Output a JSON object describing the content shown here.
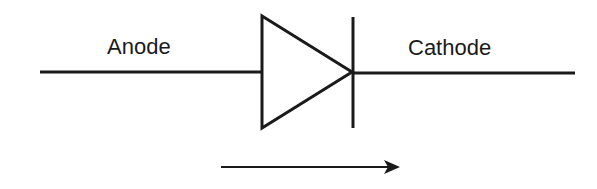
{
  "diagram": {
    "labels": {
      "anode": "Anode",
      "cathode": "Cathode"
    },
    "colors": {
      "stroke": "#1a1a1a",
      "background": "#ffffff"
    },
    "arrow_direction": "left-to-right"
  }
}
